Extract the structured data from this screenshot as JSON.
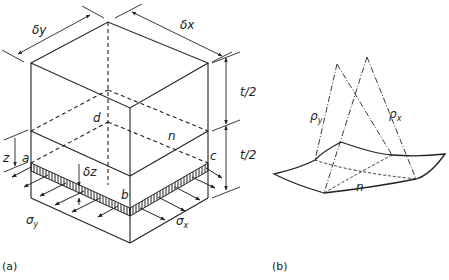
{
  "figure": {
    "panel_a": {
      "caption": "(a)",
      "labels": {
        "dy": "δy",
        "dx": "δx",
        "half_t_top": "t/2",
        "half_t_bottom": "t/2",
        "d": "d",
        "n": "n",
        "z": "z",
        "a": "a",
        "dz": "δz",
        "b": "b",
        "c": "c",
        "sigma_y": "σ",
        "sigma_y_sub": "y",
        "sigma_x": "σ",
        "sigma_x_sub": "x"
      }
    },
    "panel_b": {
      "caption": "(b)",
      "labels": {
        "rho_y": "ρ",
        "rho_y_sub": "y",
        "rho_x": "ρ",
        "rho_x_sub": "x",
        "n": "n"
      }
    }
  },
  "colors": {
    "line": "#222222",
    "background": "#ffffff"
  }
}
